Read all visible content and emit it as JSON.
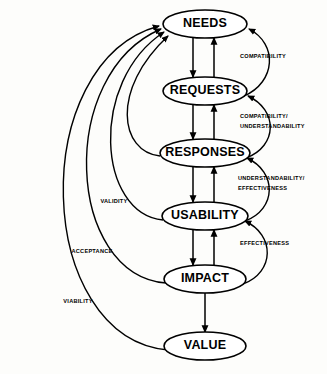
{
  "diagram": {
    "type": "flow-diagram",
    "background_color": "#fdfdfb",
    "stroke_color": "#000000",
    "node_fill_color": "#ffffff",
    "nodes": [
      {
        "id": "needs",
        "label": "NEEDS",
        "cx": 205,
        "cy": 24,
        "rx": 42,
        "ry": 14
      },
      {
        "id": "requests",
        "label": "REQUESTS",
        "cx": 205,
        "cy": 91,
        "rx": 42,
        "ry": 14
      },
      {
        "id": "responses",
        "label": "RESPONSES",
        "cx": 205,
        "cy": 153,
        "rx": 45,
        "ry": 14
      },
      {
        "id": "usability",
        "label": "USABILITY",
        "cx": 205,
        "cy": 216,
        "rx": 43,
        "ry": 14
      },
      {
        "id": "impact",
        "label": "IMPACT",
        "cx": 205,
        "cy": 279,
        "rx": 41,
        "ry": 14
      },
      {
        "id": "value",
        "label": "VALUE",
        "cx": 205,
        "cy": 346,
        "rx": 41,
        "ry": 14
      }
    ],
    "vertical_edges": [
      {
        "id": "needs-requests",
        "from": "NEEDS",
        "to": "REQUESTS",
        "direction": "bidirectional"
      },
      {
        "id": "requests-responses",
        "from": "REQUESTS",
        "to": "RESPONSES",
        "direction": "bidirectional"
      },
      {
        "id": "responses-usability",
        "from": "RESPONSES",
        "to": "USABILITY",
        "direction": "bidirectional"
      },
      {
        "id": "usability-impact",
        "from": "USABILITY",
        "to": "IMPACT",
        "direction": "bidirectional"
      },
      {
        "id": "impact-value",
        "from": "IMPACT",
        "to": "VALUE",
        "direction": "down"
      }
    ],
    "right_edges": [
      {
        "id": "compatibility",
        "from": "REQUESTS",
        "to": "NEEDS",
        "label": "COMPATIBILITY",
        "label_lines": [
          "COMPATIBILITY"
        ]
      },
      {
        "id": "compatibility-understandability",
        "from": "RESPONSES",
        "to": "REQUESTS",
        "label": "COMPATIBILITY/ UNDERSTANDABILITY",
        "label_lines": [
          "COMPATIBILITY/",
          "UNDERSTANDABILITY"
        ]
      },
      {
        "id": "understandability-effectiveness",
        "from": "USABILITY",
        "to": "RESPONSES",
        "label": "UNDERSTANDABILITY/ EFFECTIVENESS",
        "label_lines": [
          "UNDERSTANDABILITY/",
          "EFFECTIVENESS"
        ]
      },
      {
        "id": "effectiveness",
        "from": "IMPACT",
        "to": "USABILITY",
        "label": "EFFECTIVENESS",
        "label_lines": [
          "EFFECTIVENESS"
        ]
      }
    ],
    "left_edges": [
      {
        "id": "feedback-responses",
        "from": "RESPONSES",
        "to": "NEEDS",
        "label": "",
        "label_lines": []
      },
      {
        "id": "validity",
        "from": "USABILITY",
        "to": "NEEDS",
        "label": "VALIDITY",
        "label_lines": [
          "VALIDITY"
        ]
      },
      {
        "id": "acceptance",
        "from": "IMPACT",
        "to": "NEEDS",
        "label": "ACCEPTANCE",
        "label_lines": [
          "ACCEPTANCE"
        ]
      },
      {
        "id": "viability",
        "from": "VALUE",
        "to": "NEEDS",
        "label": "VIABILITY",
        "label_lines": [
          "VIABILITY"
        ]
      }
    ]
  }
}
